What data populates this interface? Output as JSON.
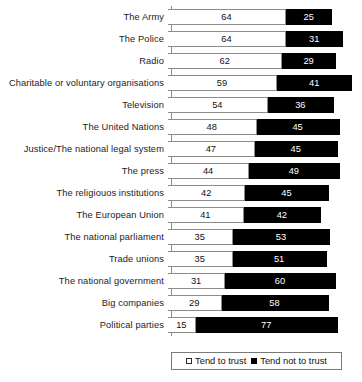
{
  "chart_data": {
    "type": "bar",
    "orientation": "horizontal",
    "stacked": true,
    "title": "",
    "subtitle": "",
    "xlabel": "",
    "ylabel": "",
    "xlim": [
      0,
      100
    ],
    "grid": false,
    "legend_position": "bottom",
    "categories": [
      "The Army",
      "The Police",
      "Radio",
      "Charitable or voluntary organisations",
      "Television",
      "The United Nations",
      "Justice/The national legal system",
      "The press",
      "The religiouos institutions",
      "The European Union",
      "The national parliament",
      "Trade unions",
      "The national government",
      "Big companies",
      "Political parties"
    ],
    "series": [
      {
        "name": "Tend to trust",
        "color": "#ffffff",
        "values": [
          64,
          64,
          62,
          59,
          54,
          48,
          47,
          44,
          42,
          41,
          35,
          35,
          31,
          29,
          15
        ]
      },
      {
        "name": "Tend not to trust",
        "color": "#000000",
        "values": [
          25,
          31,
          29,
          41,
          36,
          45,
          45,
          49,
          45,
          42,
          53,
          51,
          60,
          58,
          77
        ]
      }
    ]
  },
  "legend": {
    "trust_label": "Tend to trust",
    "not_trust_label": "Tend not to trust"
  }
}
